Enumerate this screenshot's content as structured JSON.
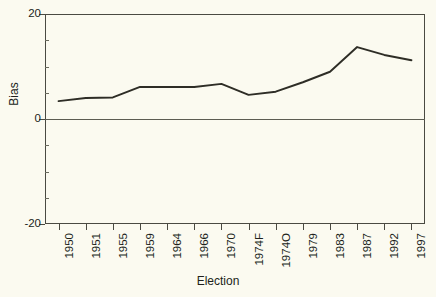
{
  "chart_data": {
    "type": "line",
    "title": "",
    "xlabel": "Election",
    "ylabel": "Bias",
    "categories": [
      "1950",
      "1951",
      "1955",
      "1959",
      "1964",
      "1966",
      "1970",
      "1974F",
      "1974O",
      "1979",
      "1983",
      "1987",
      "1992",
      "1997"
    ],
    "values": [
      3.4,
      4.0,
      4.1,
      6.1,
      6.1,
      6.1,
      6.7,
      4.6,
      5.2,
      7.0,
      9.0,
      13.7,
      12.2,
      11.2
    ],
    "series": [
      {
        "name": "Bias",
        "values": [
          3.4,
          4.0,
          4.1,
          6.1,
          6.1,
          6.1,
          6.7,
          4.6,
          5.2,
          7.0,
          9.0,
          13.7,
          12.2,
          11.2
        ]
      }
    ],
    "ylim": [
      -20,
      20
    ],
    "ytick_labels": [
      "20",
      "0",
      "-20"
    ],
    "ytick_values": [
      20,
      0,
      -20
    ],
    "yminor_values": [
      15,
      10,
      5,
      -5,
      -10,
      -15
    ],
    "grid": false,
    "legend": "none",
    "zero_reference_line": true,
    "line_color": "#2e2d26",
    "background_color": "#fbfaf0",
    "axis_color": "#4a4a42"
  },
  "axes": {
    "x_title": "Election",
    "y_title": "Bias"
  }
}
